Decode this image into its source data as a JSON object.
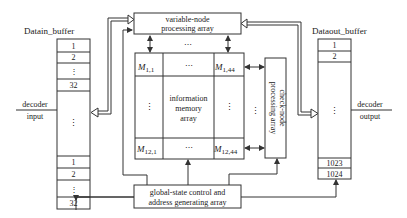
{
  "diagram": {
    "datain_buffer": {
      "title": "Datain_buffer",
      "top_cells": [
        "1",
        "2",
        "⋮",
        "32"
      ],
      "middle": "⋮",
      "bottom_cells": [
        "1",
        "2",
        "⋮",
        "32"
      ]
    },
    "dataout_buffer": {
      "title": "Dataout_buffer",
      "top_cells": [
        "1",
        "2"
      ],
      "middle": "⋮",
      "bottom_cells": [
        "1023",
        "1024"
      ]
    },
    "variable_node": {
      "line1": "variable-node",
      "line2": "processing array"
    },
    "between_dots": "⋯",
    "memory": {
      "m11": "M",
      "m11_sub": "1,1",
      "m1_44": "M",
      "m1_44_sub": "1,44",
      "m12_1": "M",
      "m12_1_sub": "12,1",
      "m12_44": "M",
      "m12_44_sub": "12,44",
      "hdots": "⋯",
      "vdots": "⋮",
      "center_line1": "information",
      "center_line2": "memory",
      "center_line3": "array"
    },
    "check_node": {
      "line1": "check-node",
      "line2": "processing array",
      "vdots": "⋮"
    },
    "global_state": {
      "line1": "global-state control and",
      "line2": "address generating array"
    },
    "decoder_input": {
      "line1": "decoder",
      "line2": "input"
    },
    "decoder_output": {
      "line1": "decoder",
      "line2": "output"
    }
  }
}
